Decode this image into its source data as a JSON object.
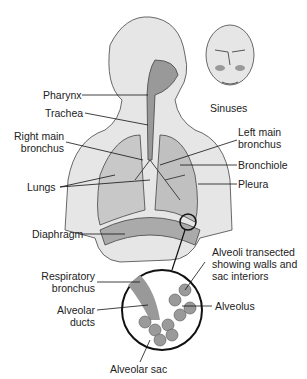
{
  "labels": {
    "pharynx": "Pharynx",
    "trachea": "Trachea",
    "right_main_bronchus_1": "Right main",
    "right_main_bronchus_2": "bronchus",
    "lungs": "Lungs",
    "diaphragm": "Diaphragm",
    "sinuses": "Sinuses",
    "left_main_bronchus_1": "Left main",
    "left_main_bronchus_2": "bronchus",
    "bronchiole": "Bronchiole",
    "pleura": "Pleura",
    "alveoli_1": "Alveoli transected",
    "alveoli_2": "showing walls and",
    "alveoli_3": "sac interiors",
    "respiratory_bronchus_1": "Respiratory",
    "respiratory_bronchus_2": "bronchus",
    "alveolar_ducts_1": "Alveolar",
    "alveolar_ducts_2": "ducts",
    "alveolus": "Alveolus",
    "alveolar_sac": "Alveolar sac"
  }
}
